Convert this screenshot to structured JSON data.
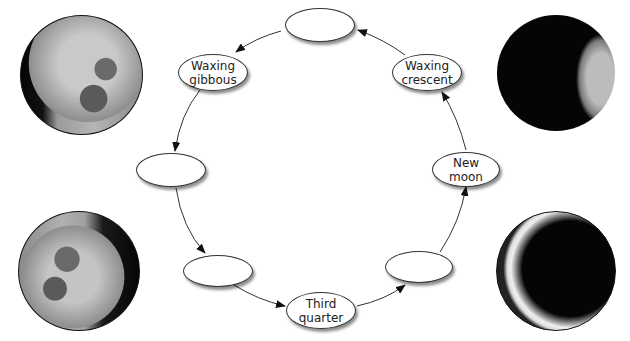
{
  "diagram": {
    "type": "cycle",
    "title": "",
    "nodes": [
      {
        "id": "top",
        "lines": [
          "",
          ""
        ],
        "blank": true
      },
      {
        "id": "waxing-gibbous",
        "lines": [
          "Waxing",
          "gibbous"
        ],
        "blank": false
      },
      {
        "id": "left",
        "lines": [
          "",
          ""
        ],
        "blank": true
      },
      {
        "id": "bottom-left",
        "lines": [
          "",
          ""
        ],
        "blank": true
      },
      {
        "id": "third-quarter",
        "lines": [
          "Third",
          "quarter"
        ],
        "blank": false
      },
      {
        "id": "bottom-right",
        "lines": [
          "",
          ""
        ],
        "blank": true
      },
      {
        "id": "new-moon",
        "lines": [
          "New",
          "moon"
        ],
        "blank": false
      },
      {
        "id": "waxing-crescent",
        "lines": [
          "Waxing",
          "crescent"
        ],
        "blank": false
      }
    ],
    "edges": [
      {
        "from": "top",
        "to": "waxing-gibbous"
      },
      {
        "from": "waxing-gibbous",
        "to": "left"
      },
      {
        "from": "left",
        "to": "bottom-left"
      },
      {
        "from": "bottom-left",
        "to": "third-quarter"
      },
      {
        "from": "third-quarter",
        "to": "bottom-right"
      },
      {
        "from": "bottom-right",
        "to": "new-moon"
      },
      {
        "from": "new-moon",
        "to": "waxing-crescent"
      },
      {
        "from": "waxing-crescent",
        "to": "top"
      }
    ],
    "moon_images": [
      {
        "position": "top-left",
        "phase": "waxing-gibbous-photo"
      },
      {
        "position": "top-right",
        "phase": "waning-crescent-photo"
      },
      {
        "position": "bottom-left",
        "phase": "waning-gibbous-photo"
      },
      {
        "position": "bottom-right",
        "phase": "thin-crescent-photo"
      }
    ],
    "colors": {
      "line": "#333333",
      "node_fill": "#ffffff",
      "moon_dark": "#050505",
      "moon_light": "#bdbdbd"
    }
  }
}
